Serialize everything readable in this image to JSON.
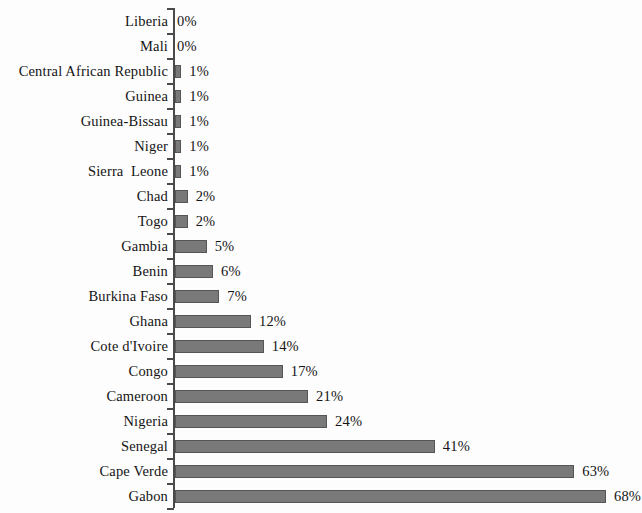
{
  "chart_data": {
    "type": "bar",
    "orientation": "horizontal",
    "title": "",
    "subtitle": "",
    "xlabel": "",
    "ylabel": "",
    "categories": [
      "Liberia",
      "Mali",
      "Central African Republic",
      "Guinea",
      "Guinea-Bissau",
      "Niger",
      "Sierra  Leone",
      "Chad",
      "Togo",
      "Gambia",
      "Benin",
      "Burkina Faso",
      "Ghana",
      "Cote d'Ivoire",
      "Congo",
      "Cameroon",
      "Nigeria",
      "Senegal",
      "Cape Verde",
      "Gabon"
    ],
    "values": [
      0,
      0,
      1,
      1,
      1,
      1,
      1,
      2,
      2,
      5,
      6,
      7,
      12,
      14,
      17,
      21,
      24,
      41,
      63,
      68
    ],
    "value_labels": [
      "0%",
      "0%",
      "1%",
      "1%",
      "1%",
      "1%",
      "1%",
      "2%",
      "2%",
      "5%",
      "6%",
      "7%",
      "12%",
      "14%",
      "17%",
      "21%",
      "24%",
      "41%",
      "63%",
      "68%"
    ],
    "unit": "%",
    "xlim": [
      0,
      68
    ],
    "grid": false,
    "legend": false,
    "legend_position": "none",
    "bar_color": "#797979",
    "bar_border_color": "#555555",
    "axis_color": "#4a4a4a",
    "background_color": "#fdfdfd",
    "text_color": "#141414"
  }
}
